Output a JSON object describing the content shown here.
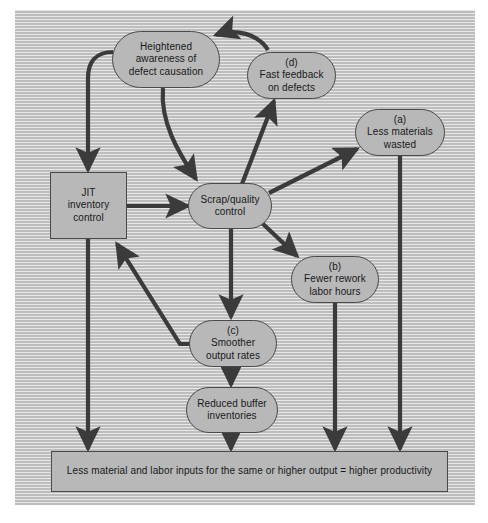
{
  "diagram": {
    "title_text": "JIT productivity cause-and-effect diagram",
    "colors": {
      "panel_bg": "#c9c9c9",
      "node_fill": "#b8b8b8",
      "node_border": "#4a4a4a",
      "arrow": "#3b3b3b",
      "text": "#17181a"
    },
    "nodes": [
      {
        "id": "awareness",
        "shape": "oval",
        "lines": [
          "Heightened",
          "awareness of",
          "defect causation"
        ],
        "label": "",
        "text": "Heightened awareness of defect causation"
      },
      {
        "id": "fast_feedback",
        "shape": "oval",
        "lines": [
          "(d)",
          "Fast feedback",
          "on defects"
        ],
        "label": "(d)",
        "text": "Fast feedback on defects"
      },
      {
        "id": "less_materials",
        "shape": "oval",
        "lines": [
          "(a)",
          "Less materials",
          "wasted"
        ],
        "label": "(a)",
        "text": "Less materials wasted"
      },
      {
        "id": "jit",
        "shape": "rect",
        "lines": [
          "JIT",
          "inventory",
          "control"
        ],
        "label": "",
        "text": "JIT inventory control"
      },
      {
        "id": "scrap",
        "shape": "oval",
        "lines": [
          "Scrap/quality",
          "control"
        ],
        "label": "",
        "text": "Scrap/quality control"
      },
      {
        "id": "fewer_rework",
        "shape": "oval",
        "lines": [
          "(b)",
          "Fewer rework",
          "labor hours"
        ],
        "label": "(b)",
        "text": "Fewer rework labor hours"
      },
      {
        "id": "smoother",
        "shape": "oval",
        "lines": [
          "(c)",
          "Smoother",
          "output rates"
        ],
        "label": "(c)",
        "text": "Smoother output rates"
      },
      {
        "id": "reduced_buffer",
        "shape": "oval",
        "lines": [
          "Reduced buffer",
          "inventories"
        ],
        "label": "",
        "text": "Reduced buffer inventories"
      },
      {
        "id": "outcome",
        "shape": "rect",
        "lines": [
          "Less material and labor inputs for the same or higher output = higher productivity"
        ],
        "label": "",
        "text": "Less material and labor inputs for the same or higher output = higher productivity"
      }
    ],
    "node_text": {
      "awareness_l1": "Heightened",
      "awareness_l2": "awareness of",
      "awareness_l3": "defect causation",
      "fast_feedback_l1": "(d)",
      "fast_feedback_l2": "Fast feedback",
      "fast_feedback_l3": "on defects",
      "less_materials_l1": "(a)",
      "less_materials_l2": "Less materials",
      "less_materials_l3": "wasted",
      "jit_l1": "JIT",
      "jit_l2": "inventory",
      "jit_l3": "control",
      "scrap_l1": "Scrap/quality",
      "scrap_l2": "control",
      "fewer_rework_l1": "(b)",
      "fewer_rework_l2": "Fewer rework",
      "fewer_rework_l3": "labor hours",
      "smoother_l1": "(c)",
      "smoother_l2": "Smoother",
      "smoother_l3": "output rates",
      "reduced_buffer_l1": "Reduced buffer",
      "reduced_buffer_l2": "inventories",
      "outcome_l1": "Less material and labor inputs for the same or higher output = higher productivity"
    },
    "edges": [
      {
        "id": "fast-feedback-to-awareness",
        "from": "fast_feedback",
        "to": "awareness",
        "style": "curved"
      },
      {
        "id": "awareness-to-jit",
        "from": "awareness",
        "to": "jit",
        "style": "curved"
      },
      {
        "id": "awareness-to-scrap",
        "from": "awareness",
        "to": "scrap",
        "style": "curved"
      },
      {
        "id": "scrap-to-fast-feedback",
        "from": "scrap",
        "to": "fast_feedback",
        "style": "straight"
      },
      {
        "id": "jit-to-scrap",
        "from": "jit",
        "to": "scrap",
        "style": "straight"
      },
      {
        "id": "scrap-to-less-materials",
        "from": "scrap",
        "to": "less_materials",
        "style": "straight"
      },
      {
        "id": "scrap-to-fewer-rework",
        "from": "scrap",
        "to": "fewer_rework",
        "style": "straight"
      },
      {
        "id": "scrap-to-smoother",
        "from": "scrap",
        "to": "smoother",
        "style": "straight"
      },
      {
        "id": "smoother-to-jit",
        "from": "smoother",
        "to": "jit",
        "style": "elbow"
      },
      {
        "id": "smoother-to-reduced-buffer",
        "from": "smoother",
        "to": "reduced_buffer",
        "style": "straight"
      },
      {
        "id": "jit-to-outcome",
        "from": "jit",
        "to": "outcome",
        "style": "straight"
      },
      {
        "id": "reduced-buffer-to-outcome",
        "from": "reduced_buffer",
        "to": "outcome",
        "style": "straight"
      },
      {
        "id": "fewer-rework-to-outcome",
        "from": "fewer_rework",
        "to": "outcome",
        "style": "straight"
      },
      {
        "id": "less-materials-to-outcome",
        "from": "less_materials",
        "to": "outcome",
        "style": "straight"
      }
    ]
  }
}
